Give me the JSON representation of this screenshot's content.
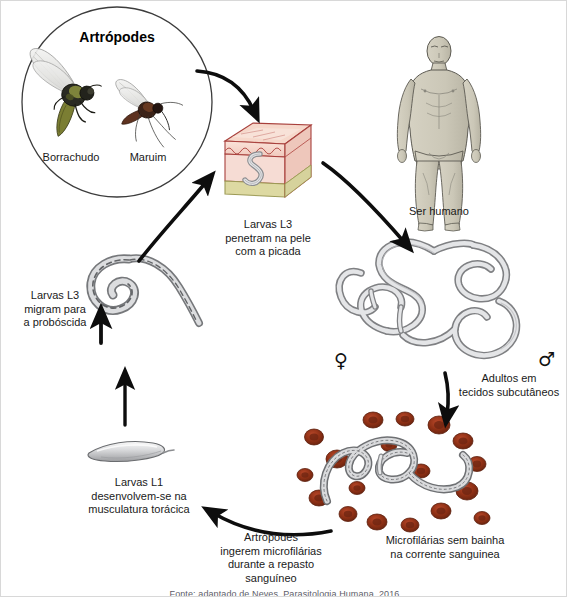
{
  "figure": {
    "language": "pt-BR",
    "background_color": "#ffffff"
  },
  "arthropod_circle": {
    "title": "Artrópodes",
    "vectors": [
      {
        "name": "Borrachudo",
        "icon": "blackfly-icon"
      },
      {
        "name": "Maruim",
        "icon": "midge-icon"
      }
    ]
  },
  "stages": {
    "skin_penetration": {
      "label": "Larvas L3\npenetram na pele\ncom a picada",
      "icon": "skin-block-icon"
    },
    "human_host": {
      "label": "Ser humano",
      "icon": "human-body-icon"
    },
    "adults": {
      "label": "Adultos em\ntecidos subcutâneos",
      "icon": "adult-worms-icon",
      "female_symbol": "♀",
      "male_symbol": "♂"
    },
    "microfilariae": {
      "label": "Microfilárias sem bainha\nna corrente sanguinea",
      "icon": "microfilaria-blood-icon"
    },
    "ingestion": {
      "label": "Artrópodes\ningerem microfilárias\ndurante a repasto\nsanguíneo",
      "icon": "blood-meal-icon"
    },
    "l1_larvae": {
      "label": "Larvas L1\ndesenvolvem-se na\nmusculatura torácica",
      "icon": "l1-larva-icon"
    },
    "l3_proboscis": {
      "label": "Larvas L3\nmigram para\na probóscida",
      "icon": "l3-larva-icon"
    }
  },
  "colors": {
    "arrow": "#0d0d0d",
    "skin_epidermis": "#f3d3c8",
    "skin_dermis": "#f6dcd4",
    "skin_fat": "#ddd9a2",
    "skin_outline": "#a8403c",
    "worm_grey": "#d3d4d6",
    "worm_outline": "#3a3a3c",
    "blood_cell": "#9c3317",
    "blood_cell_dark": "#6e2310",
    "human_skin": "#ccc8b8",
    "human_outline": "#5c5a52",
    "circle_stroke": "#3c3c3c",
    "text": "#1a1a1a"
  },
  "caption": {
    "text": "Fonte: adaptado de Neves, Parasitologia Humana, 2016"
  }
}
